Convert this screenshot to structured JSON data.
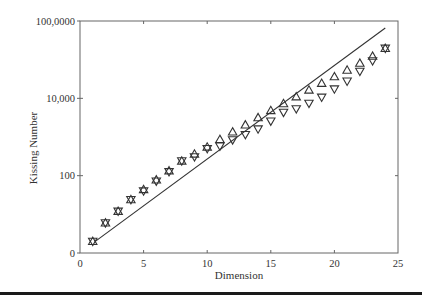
{
  "chart_data": {
    "type": "scatter",
    "title": "",
    "xlabel": "Dimension",
    "ylabel": "Kissing Number",
    "xlim": [
      0,
      25
    ],
    "ylim": [
      1,
      1000000
    ],
    "yscale": "log",
    "grid": false,
    "legend": null,
    "x_ticks": [
      0,
      5,
      10,
      15,
      20,
      25
    ],
    "x_tick_labels": [
      "0",
      "5",
      "10",
      "15",
      "20",
      "25"
    ],
    "y_ticks": [
      1,
      100,
      10000,
      1000000
    ],
    "y_tick_labels": [
      "0",
      "100",
      "10,000",
      "100,0000"
    ],
    "x": [
      1,
      2,
      3,
      4,
      5,
      6,
      7,
      8,
      9,
      10,
      11,
      12,
      13,
      14,
      15,
      16,
      17,
      18,
      19,
      20,
      21,
      22,
      23,
      24
    ],
    "series": [
      {
        "name": "Upper bound",
        "marker": "triangle-up",
        "values": [
          2,
          6,
          12,
          24,
          44,
          78,
          134,
          240,
          363,
          553,
          869,
          1356,
          2066,
          3177,
          4858,
          7332,
          11014,
          16469,
          24575,
          36402,
          53878,
          81376,
          123328,
          196560
        ]
      },
      {
        "name": "Lower bound",
        "marker": "triangle-down",
        "values": [
          2,
          6,
          12,
          24,
          40,
          72,
          126,
          240,
          306,
          500,
          582,
          840,
          1154,
          1606,
          2564,
          4320,
          5346,
          7398,
          10668,
          17400,
          27720,
          49896,
          93150,
          196560
        ]
      },
      {
        "name": "Trend line",
        "type": "line",
        "x": [
          1.2,
          24
        ],
        "values": [
          2,
          660000
        ]
      }
    ],
    "colors": {
      "marker": "#333333",
      "line": "#333333",
      "axes": "#666666"
    }
  }
}
